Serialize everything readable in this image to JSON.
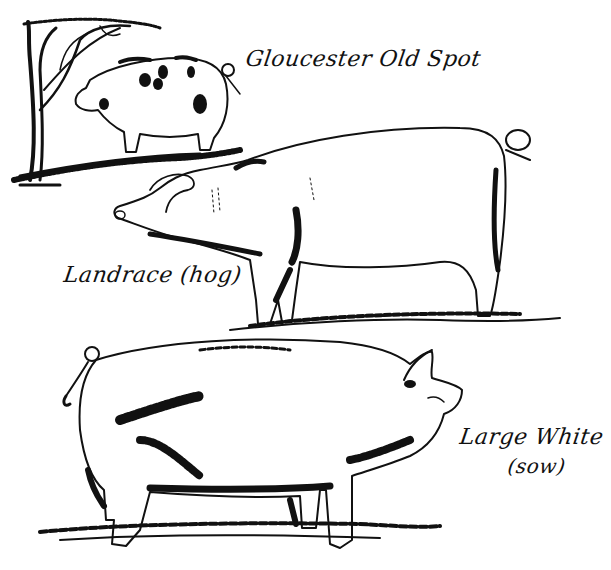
{
  "illustration": {
    "style": "black ink line drawing on white",
    "colors": {
      "ink": "#111111",
      "paper": "#ffffff"
    },
    "breeds": [
      {
        "name": "Gloucester Old Spot",
        "note": "",
        "position": "top-left, beside tree, facing left"
      },
      {
        "name": "Landrace",
        "note": "(hog)",
        "position": "middle, facing left"
      },
      {
        "name": "Large White",
        "note": "(sow)",
        "position": "bottom, facing right"
      }
    ]
  },
  "labels": {
    "gloucester": "Gloucester Old Spot",
    "landrace": "Landrace (hog)",
    "large_white_name": "Large White",
    "large_white_note": "(sow)"
  }
}
